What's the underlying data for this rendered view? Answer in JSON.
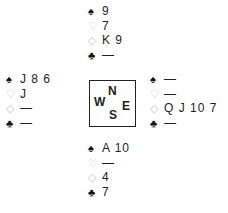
{
  "suits": {
    "spades": {
      "glyph": "♠",
      "color": "#111111"
    },
    "hearts": {
      "glyph": "♡",
      "color": "#c8c8c8"
    },
    "diamonds": {
      "glyph": "◇",
      "color": "#c8c8c8"
    },
    "clubs": {
      "glyph": "♣",
      "color": "#111111"
    }
  },
  "compass": {
    "north": "N",
    "west": "W",
    "east": "E",
    "south": "S"
  },
  "hands": {
    "north": {
      "spades": "9",
      "hearts": "7",
      "diamonds": "K 9",
      "clubs": "—"
    },
    "west": {
      "spades": "J 8 6",
      "hearts": "J",
      "diamonds": "—",
      "clubs": "—"
    },
    "east": {
      "spades": "—",
      "hearts": "—",
      "diamonds": "Q J 10 7",
      "clubs": "—"
    },
    "south": {
      "spades": "A 10",
      "hearts": "—",
      "diamonds": "4",
      "clubs": "7"
    }
  }
}
